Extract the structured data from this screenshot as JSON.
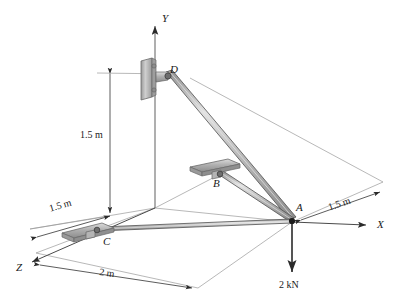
{
  "figure": {
    "kind": "statics-free-body-diagram",
    "background_color": "#ffffff",
    "line_color": "#3a3a3a",
    "thin_line_color": "#8a8a8a",
    "member_fill": "#c8c8c8",
    "member_edge": "#555555",
    "plate_fill": "#b8b8b8",
    "plate_edge": "#6a6a6a",
    "text_color": "#1a1a1a"
  },
  "axes": [
    {
      "id": "y-axis",
      "label": "Y",
      "label_x": 162,
      "label_y": 13
    },
    {
      "id": "x-axis",
      "label": "X",
      "label_x": 377,
      "label_y": 225
    },
    {
      "id": "z-axis",
      "label": "Z",
      "label_x": 18,
      "label_y": 268
    }
  ],
  "points": [
    {
      "id": "point-a",
      "label": "A",
      "label_x": 296,
      "label_y": 208
    },
    {
      "id": "point-b",
      "label": "B",
      "label_x": 213,
      "label_y": 182
    },
    {
      "id": "point-c",
      "label": "C",
      "label_x": 103,
      "label_y": 240
    },
    {
      "id": "point-d",
      "label": "D",
      "label_x": 170,
      "label_y": 69
    }
  ],
  "dimensions": [
    {
      "id": "dim-height",
      "label": "1.5 m",
      "label_x": 101,
      "label_y": 135,
      "value": 1.5,
      "unit": "m",
      "orientation": "vertical"
    },
    {
      "id": "dim-left",
      "label": "1.5 m",
      "label_x": 53,
      "label_y": 206,
      "value": 1.5,
      "unit": "m",
      "orientation": "z-left"
    },
    {
      "id": "dim-right",
      "label": "1.5 m",
      "label_x": 332,
      "label_y": 206,
      "value": 1.5,
      "unit": "m",
      "orientation": "z-right"
    },
    {
      "id": "dim-depth",
      "label": "2 m",
      "label_x": 107,
      "label_y": 270,
      "value": 2,
      "unit": "m",
      "orientation": "x-depth"
    }
  ],
  "load": {
    "id": "applied-load",
    "label": "2 kN",
    "label_x": 280,
    "label_y": 284,
    "magnitude": 2,
    "unit": "kN",
    "direction": "downward"
  },
  "members": [
    {
      "id": "member-ad",
      "from": "A",
      "to": "D"
    },
    {
      "id": "member-ab",
      "from": "A",
      "to": "B"
    },
    {
      "id": "member-ac",
      "from": "A",
      "to": "C"
    }
  ],
  "supports": [
    {
      "id": "support-d",
      "at": "D",
      "type": "wall-plate-vertical"
    },
    {
      "id": "support-b",
      "at": "B",
      "type": "plate-horizontal"
    },
    {
      "id": "support-c",
      "at": "C",
      "type": "plate-horizontal"
    }
  ]
}
